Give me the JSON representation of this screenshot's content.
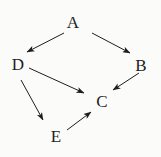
{
  "diagram": {
    "type": "directed-graph",
    "nodes": [
      {
        "id": "A",
        "label": "A",
        "x": 73,
        "y": 22
      },
      {
        "id": "B",
        "label": "B",
        "x": 141,
        "y": 65
      },
      {
        "id": "C",
        "label": "C",
        "x": 102,
        "y": 101
      },
      {
        "id": "D",
        "label": "D",
        "x": 18,
        "y": 64
      },
      {
        "id": "E",
        "label": "E",
        "x": 56,
        "y": 136
      }
    ],
    "edges": [
      {
        "from": "A",
        "to": "D"
      },
      {
        "from": "A",
        "to": "B"
      },
      {
        "from": "D",
        "to": "C"
      },
      {
        "from": "B",
        "to": "C"
      },
      {
        "from": "D",
        "to": "E"
      },
      {
        "from": "E",
        "to": "C"
      }
    ],
    "colors": {
      "background": "#fbfbfa",
      "stroke": "#1e1e1e",
      "text": "#1e1e1e"
    }
  }
}
